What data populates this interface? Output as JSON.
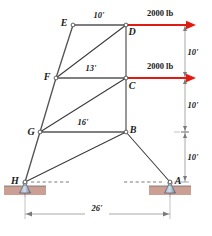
{
  "figure": {
    "accent_force_color": "#e01b12",
    "member_color": "#3a3a3a",
    "ground_color": "#c99a8e"
  },
  "nodes": [
    {
      "id": "E",
      "label": "E",
      "x": 73,
      "y": 25
    },
    {
      "id": "D",
      "label": "D",
      "x": 126,
      "y": 25
    },
    {
      "id": "F",
      "label": "F",
      "x": 56,
      "y": 78
    },
    {
      "id": "C",
      "label": "C",
      "x": 126,
      "y": 78
    },
    {
      "id": "G",
      "label": "G",
      "x": 40,
      "y": 132
    },
    {
      "id": "B",
      "label": "B",
      "x": 126,
      "y": 132
    },
    {
      "id": "H",
      "label": "H",
      "x": 25,
      "y": 182
    },
    {
      "id": "A",
      "label": "A",
      "x": 170,
      "y": 182
    }
  ],
  "members": [
    {
      "from": "E",
      "to": "D",
      "kind": "chord"
    },
    {
      "from": "E",
      "to": "F",
      "kind": "chord"
    },
    {
      "from": "F",
      "to": "G",
      "kind": "chord"
    },
    {
      "from": "G",
      "to": "H",
      "kind": "chord"
    },
    {
      "from": "F",
      "to": "C",
      "kind": "chord"
    },
    {
      "from": "G",
      "to": "B",
      "kind": "chord"
    },
    {
      "from": "D",
      "to": "C",
      "kind": "member"
    },
    {
      "from": "C",
      "to": "B",
      "kind": "member"
    },
    {
      "from": "F",
      "to": "D",
      "kind": "member"
    },
    {
      "from": "G",
      "to": "C",
      "kind": "member"
    },
    {
      "from": "H",
      "to": "B",
      "kind": "member"
    },
    {
      "from": "B",
      "to": "A",
      "kind": "member"
    }
  ],
  "member_dimensions": [
    {
      "name": "top-chord-length",
      "value": "10'",
      "x": 99,
      "y": 18
    },
    {
      "name": "middle-chord-length",
      "value": "13'",
      "x": 91,
      "y": 71
    },
    {
      "name": "lower-chord-length",
      "value": "16'",
      "x": 83,
      "y": 125
    }
  ],
  "forces": [
    {
      "name": "force-at-D",
      "label": "2000 lb",
      "from_x": 126,
      "from_y": 25,
      "to_x": 196,
      "to_y": 25,
      "label_x": 160,
      "label_y": 16
    },
    {
      "name": "force-at-C",
      "label": "2000 lb",
      "from_x": 126,
      "from_y": 78,
      "to_x": 196,
      "to_y": 78,
      "label_x": 160,
      "label_y": 69
    }
  ],
  "vertical_dimensions": [
    {
      "name": "height-D-to-C",
      "value": "10'",
      "y_top": 25,
      "y_bottom": 78,
      "label_x": 193,
      "label_y": 55
    },
    {
      "name": "height-C-to-B",
      "value": "10'",
      "y_top": 78,
      "y_bottom": 132,
      "label_x": 193,
      "label_y": 108
    },
    {
      "name": "height-B-to-A",
      "value": "10'",
      "y_top": 132,
      "y_bottom": 182,
      "label_x": 193,
      "label_y": 160
    }
  ],
  "span_dimension": {
    "name": "span-H-to-A",
    "value": "26'",
    "x_left": 25,
    "x_right": 170,
    "y": 214,
    "label_x": 97,
    "label_y": 211
  },
  "supports": [
    {
      "name": "pin-support-H",
      "node": "H",
      "x": 25,
      "y": 182,
      "type": "pin"
    },
    {
      "name": "pin-support-A",
      "node": "A",
      "x": 170,
      "y": 182,
      "type": "pin"
    }
  ]
}
